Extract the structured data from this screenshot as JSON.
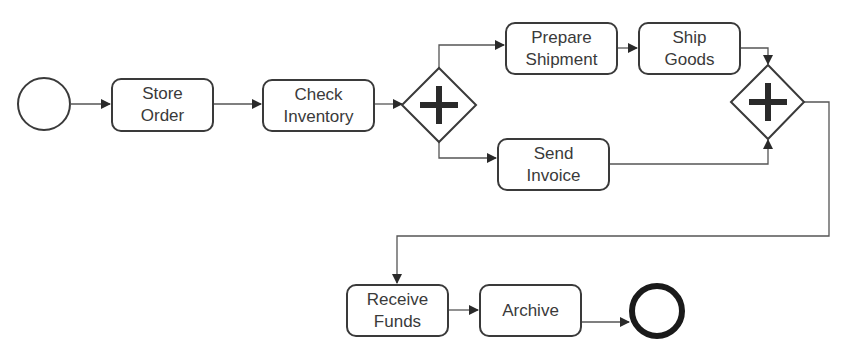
{
  "diagram": {
    "type": "BPMN process",
    "colors": {
      "stroke": "#3a3a3a",
      "background": "#ffffff",
      "marker": "#2a2a2a"
    },
    "start_event": {
      "label": ""
    },
    "end_event": {
      "label": ""
    },
    "tasks": [
      {
        "id": "store_order",
        "label": "Store\nOrder"
      },
      {
        "id": "check_inventory",
        "label": "Check\nInventory"
      },
      {
        "id": "prepare_shipment",
        "label": "Prepare\nShipment"
      },
      {
        "id": "ship_goods",
        "label": "Ship\nGoods"
      },
      {
        "id": "send_invoice",
        "label": "Send\nInvoice"
      },
      {
        "id": "receive_funds",
        "label": "Receive\nFunds"
      },
      {
        "id": "archive",
        "label": "Archive"
      }
    ],
    "gateways": [
      {
        "id": "split",
        "type": "parallel",
        "icon": "plus-icon"
      },
      {
        "id": "join",
        "type": "parallel",
        "icon": "plus-icon"
      }
    ],
    "flows": [
      [
        "start",
        "store_order"
      ],
      [
        "store_order",
        "check_inventory"
      ],
      [
        "check_inventory",
        "split"
      ],
      [
        "split",
        "prepare_shipment"
      ],
      [
        "split",
        "send_invoice"
      ],
      [
        "prepare_shipment",
        "ship_goods"
      ],
      [
        "ship_goods",
        "join"
      ],
      [
        "send_invoice",
        "join"
      ],
      [
        "join",
        "receive_funds"
      ],
      [
        "receive_funds",
        "archive"
      ],
      [
        "archive",
        "end"
      ]
    ]
  }
}
